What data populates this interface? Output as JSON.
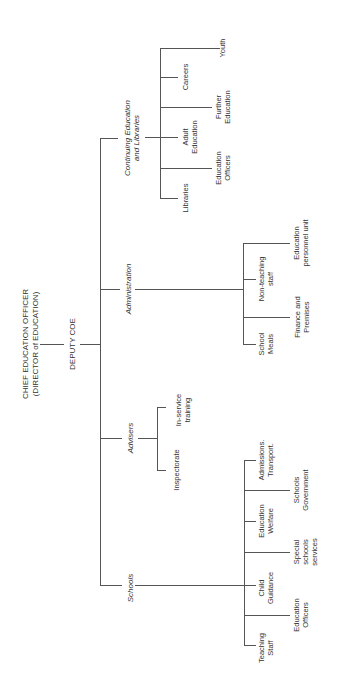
{
  "chart": {
    "root": {
      "title": "CHIEF EDUCATION OFFICER\n(DIRECTOR of EDUCATION)",
      "deputy": "DEPUTY COE"
    },
    "branches": {
      "continuing": {
        "label": "Continuing Education\nand Libraries",
        "children": [
          "Youth",
          "Careers",
          "Further\nEducation",
          "Adult\nEducation",
          "Education\nOfficers",
          "Libraries"
        ]
      },
      "administration": {
        "label": "Administration",
        "children": [
          "Education\npersonnel unit",
          "Non-teaching\nstaff",
          "Finance and\nPremises",
          "School\nMeals"
        ]
      },
      "advisers": {
        "label": "Advisers",
        "children": [
          "In-service\ntraining",
          "Inspectorate"
        ]
      },
      "schools": {
        "label": "Schools",
        "children": [
          "Admissions.\nTransport.",
          "Schools\nGovernment",
          "Education\nWelfare",
          "Special\nschools\nservices",
          "Child\nGuidance",
          "Education\nOfficers",
          "Teaching\nStaff"
        ]
      }
    }
  }
}
